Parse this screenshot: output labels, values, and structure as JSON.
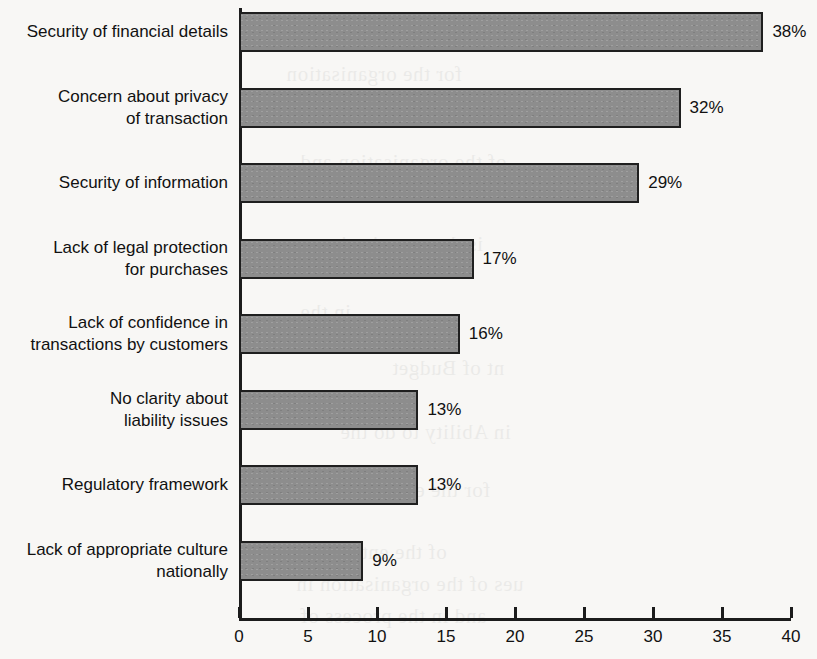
{
  "chart_data": {
    "type": "bar",
    "orientation": "horizontal",
    "title": "",
    "subtitle": "",
    "xlabel": "",
    "ylabel": "",
    "xlim": [
      0,
      40
    ],
    "xticks": [
      "0",
      "5",
      "10",
      "15",
      "20",
      "25",
      "30",
      "35",
      "40"
    ],
    "xtick_values": [
      0,
      5,
      10,
      15,
      20,
      25,
      30,
      35,
      40
    ],
    "grid": false,
    "legend": false,
    "categories": [
      "Security of financial details",
      "Concern about privacy\nof transaction",
      "Security of information",
      "Lack of legal protection\nfor purchases",
      "Lack of confidence in\ntransactions by customers",
      "No clarity about\nliability issues",
      "Regulatory framework",
      "Lack of appropriate culture\nnationally"
    ],
    "values": [
      38,
      32,
      29,
      17,
      16,
      13,
      13,
      9
    ],
    "value_labels": [
      "38%",
      "32%",
      "29%",
      "17%",
      "16%",
      "13%",
      "13%",
      "9%"
    ],
    "bar_color": "#8d8d8d",
    "bar_border_color": "#1f1f1f",
    "axis_color": "#1c1c1c",
    "background_color": "#f8f7f5"
  },
  "ghost_text": [
    {
      "text": "for the organisation",
      "x": 286,
      "y": 62
    },
    {
      "text": "of the organisation and",
      "x": 300,
      "y": 150
    },
    {
      "text": "is the organisation",
      "x": 318,
      "y": 232
    },
    {
      "text": "in the",
      "x": 300,
      "y": 300
    },
    {
      "text": "nt of Budget",
      "x": 392,
      "y": 356
    },
    {
      "text": "in Ability to do the",
      "x": 340,
      "y": 420
    },
    {
      "text": "for the enterprise",
      "x": 336,
      "y": 478
    },
    {
      "text": "of the enterprise",
      "x": 300,
      "y": 540
    },
    {
      "text": "ues of the organisation in",
      "x": 296,
      "y": 572
    },
    {
      "text": "and in the process of",
      "x": 300,
      "y": 604
    }
  ]
}
